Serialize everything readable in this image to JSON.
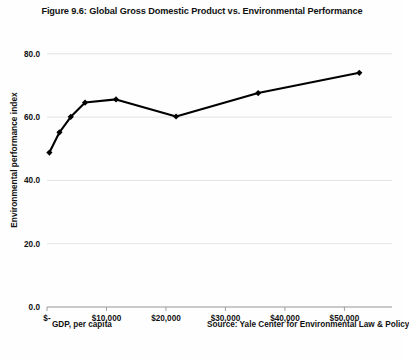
{
  "figure": {
    "title": "Figure 9.6: Global Gross Domestic Product vs. Environmental Performance",
    "xaxis_caption": "GDP, per capita",
    "source_note": "Source: Yale Center for Environmental Law & Policy",
    "line_color": "#000000",
    "gridline_color": "#d9d9d9",
    "background_color": "#fefefe"
  },
  "chart_data": {
    "type": "line",
    "title": "Figure 9.6: Global Gross Domestic Product vs. Environmental Performance",
    "xlabel": "GDP, per capita",
    "ylabel": "Environmental performance index",
    "xlim": [
      0,
      58000
    ],
    "ylim": [
      0,
      85
    ],
    "grid": true,
    "legend": false,
    "marker": "diamond",
    "x": [
      400,
      2100,
      4000,
      6400,
      11600,
      21700,
      35500,
      52500
    ],
    "y": [
      48.8,
      55.2,
      60.1,
      64.6,
      65.6,
      60.2,
      67.6,
      74.0
    ],
    "xticks": [
      0,
      10000,
      20000,
      30000,
      40000,
      50000
    ],
    "xtick_labels": [
      "$-",
      "$10,000",
      "$20,000",
      "$30,000",
      "$40,000",
      "$50,000"
    ],
    "yticks": [
      0,
      20,
      40,
      60,
      80
    ],
    "ytick_labels": [
      "0.0",
      "20.0",
      "40.0",
      "60.0",
      "80.0"
    ],
    "series": [
      {
        "name": "Environmental performance index",
        "points": [
          {
            "gdp": 400,
            "epi": 48.8
          },
          {
            "gdp": 2100,
            "epi": 55.2
          },
          {
            "gdp": 4000,
            "epi": 60.1
          },
          {
            "gdp": 6400,
            "epi": 64.6
          },
          {
            "gdp": 11600,
            "epi": 65.6
          },
          {
            "gdp": 21700,
            "epi": 60.2
          },
          {
            "gdp": 35500,
            "epi": 67.6
          },
          {
            "gdp": 52500,
            "epi": 74.0
          }
        ]
      }
    ]
  }
}
